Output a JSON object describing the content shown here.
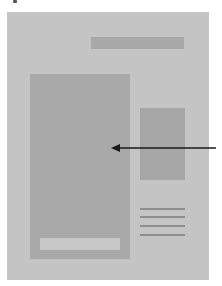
{
  "diagram": {
    "colors": {
      "background": "#ffffff",
      "page_panel": "#c4c4c4",
      "header_bar": "#a8a8a8",
      "main_block": "#a9a9a9",
      "main_inner_bar": "#c8c8c8",
      "side_block": "#a6a6a6",
      "side_lines": "#8e8e8e",
      "arrow": "#1a1a1a"
    },
    "elements": [
      {
        "name": "page-panel",
        "shape": "rectangle"
      },
      {
        "name": "header-bar",
        "shape": "rectangle"
      },
      {
        "name": "main-content-block",
        "shape": "rectangle"
      },
      {
        "name": "main-inner-bar",
        "shape": "rectangle"
      },
      {
        "name": "sidebar-block",
        "shape": "rectangle"
      },
      {
        "name": "sidebar-text-lines",
        "shape": "lines",
        "count": 4
      },
      {
        "name": "pointer-arrow",
        "shape": "arrow",
        "direction": "left",
        "target": "main-content-block"
      }
    ]
  }
}
